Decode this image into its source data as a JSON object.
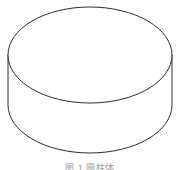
{
  "figure": {
    "kind": "3d-cylinder-line-drawing",
    "caption": "图 1  圆柱体",
    "caption_note": "clipped at bottom edge",
    "colors": {
      "background": "#ffffff",
      "stroke": "#2b2b2b",
      "fill": "#ffffff",
      "caption": "#9a9a9a"
    },
    "geometry": {
      "top_ellipse": {
        "cx": 90,
        "cy": 55,
        "rx": 82,
        "ry": 48,
        "apex_y": 7,
        "front_arc_bottom_y": 103
      },
      "bottom_ellipse": {
        "cx": 90,
        "cy": 105,
        "rx": 82,
        "ry": 48,
        "front_arc_bottom_y": 153
      },
      "side_walls": {
        "left_x": 8,
        "right_x": 172,
        "top_y": 55,
        "bottom_y": 105
      },
      "stroke_width": 1
    },
    "parts": [
      {
        "name": "top-face-ellipse",
        "label": "顶面"
      },
      {
        "name": "left-side-wall",
        "label": "左侧母线"
      },
      {
        "name": "right-side-wall",
        "label": "右侧母线"
      },
      {
        "name": "bottom-front-arc",
        "label": "底面前弧"
      }
    ]
  }
}
